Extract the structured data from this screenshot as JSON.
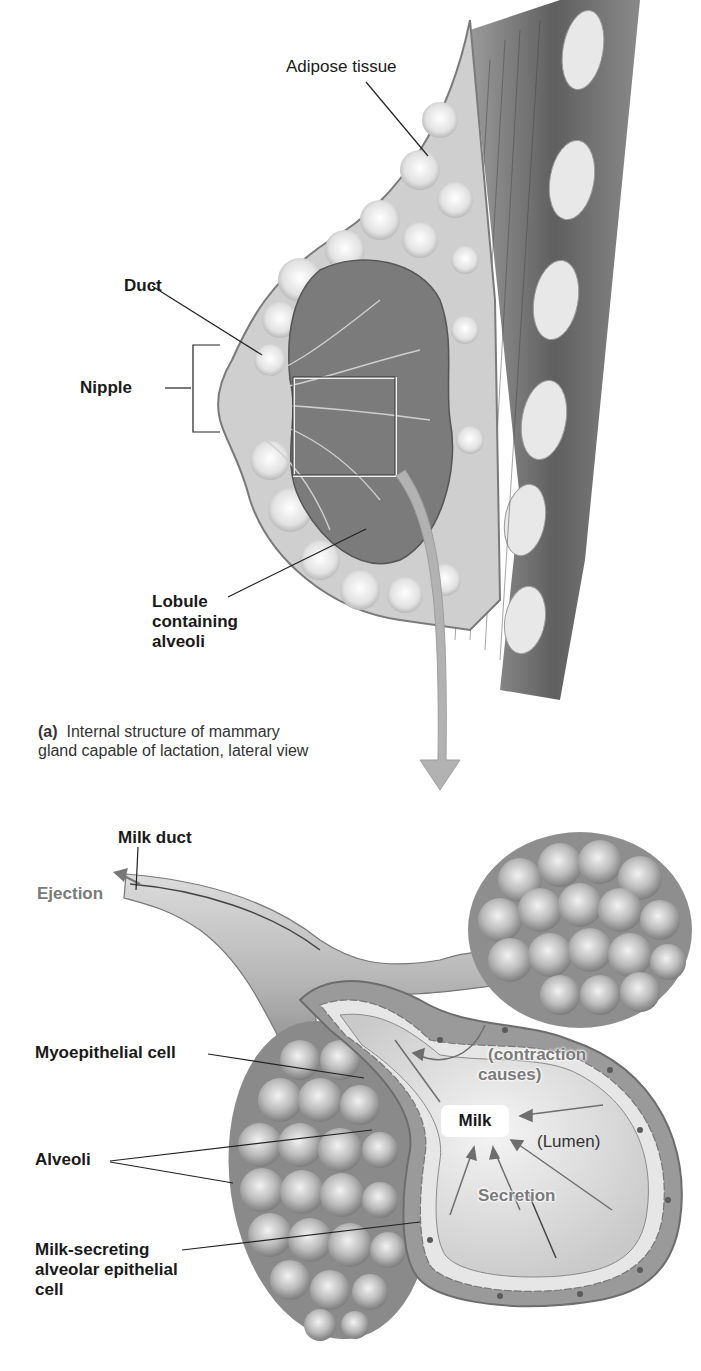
{
  "figure": {
    "panel_a": {
      "caption_tag": "(a)",
      "caption_line1": "Internal structure of mammary",
      "caption_line2": "gland capable of lactation, lateral view",
      "labels": {
        "adipose": "Adipose tissue",
        "duct": "Duct",
        "nipple": "Nipple",
        "lobule_1": "Lobule",
        "lobule_2": "containing",
        "lobule_3": "alveoli"
      }
    },
    "panel_b": {
      "labels": {
        "milk_duct": "Milk duct",
        "ejection": "Ejection",
        "myoepithelial": "Myoepithelial cell",
        "alveoli": "Alveoli",
        "secreting_1": "Milk-secreting",
        "secreting_2": "alveolar epithelial",
        "secreting_3": "cell",
        "contraction_1": "(contraction",
        "contraction_2": "causes)",
        "milk": "Milk",
        "lumen": "(Lumen)",
        "secretion": "Secretion"
      }
    },
    "colors": {
      "tissue_dark": "#6e6e6e",
      "tissue_mid": "#9a9a9a",
      "tissue_light": "#d6d6d6",
      "arrow_grey": "#a8a8a8",
      "label_grey": "#7a7a7a"
    }
  }
}
